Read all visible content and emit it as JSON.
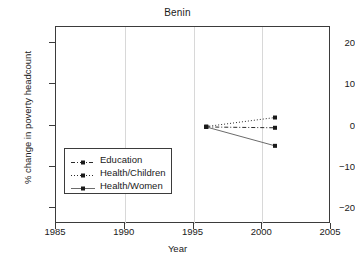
{
  "chart_data": {
    "type": "line",
    "title": "Benin",
    "xlabel": "Year",
    "ylabel": "% change in poverty headcount",
    "xlim": [
      1985,
      2005
    ],
    "ylim": [
      -24,
      24
    ],
    "xticks": [
      1985,
      1990,
      1995,
      2000,
      2005
    ],
    "xtick_labels": [
      "1985",
      "1990",
      "1995",
      "2000",
      "2005"
    ],
    "yticks": [
      20,
      10,
      0,
      -10,
      -20
    ],
    "ytick_labels": [
      "20",
      "10",
      "0",
      "−10",
      "−20"
    ],
    "grid": "vertical",
    "legend_position": "center-left",
    "x": [
      1996,
      2001
    ],
    "series": [
      {
        "name": "Education",
        "values": [
          -0.6,
          -0.8
        ],
        "linestyle": "dashdot",
        "marker": "square",
        "color": "#2b2b2b"
      },
      {
        "name": "Health/Children",
        "values": [
          -0.5,
          1.7
        ],
        "linestyle": "dotted",
        "marker": "square",
        "color": "#2b2b2b"
      },
      {
        "name": "Health/Women",
        "values": [
          -0.6,
          -5.2
        ],
        "linestyle": "solid",
        "marker": "square",
        "color": "#6b6b6b"
      }
    ]
  }
}
